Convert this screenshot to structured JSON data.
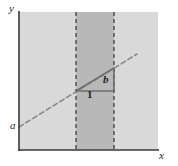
{
  "figure": {
    "axes": {
      "y_label": "y",
      "x_label": "x"
    },
    "labels": {
      "intercept": "a",
      "rise": "b",
      "run": "1"
    },
    "colors": {
      "background": "#ffffff",
      "plot_fill": "#d9d9d9",
      "band_fill": "#b8b8b8",
      "axis_stroke": "#3a3a3a",
      "line_stroke": "#8a8a8a",
      "triangle_stroke": "#6e6e6e",
      "dashed_vertical_stroke": "#4a4a4a",
      "label_color": "#1f1f1f"
    },
    "geometry": {
      "plot_left": 19,
      "plot_right": 158,
      "plot_top": 12,
      "plot_bottom": 150,
      "band_left": 76,
      "band_right": 114,
      "line_x1": 19,
      "line_y1": 127,
      "line_x2": 137,
      "line_y2": 54,
      "triangle_corner_x": 76,
      "triangle_corner_y": 91,
      "triangle_run_end_x": 114,
      "triangle_rise_top_y": 68
    }
  }
}
